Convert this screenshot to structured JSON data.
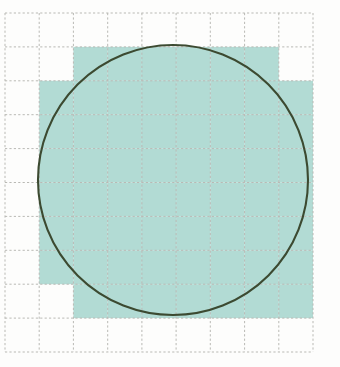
{
  "figure": {
    "background_color": "#fdfdfc"
  },
  "grid": {
    "columns": 9,
    "rows": 10,
    "origin_x": 5,
    "origin_y": 13,
    "cell_width": 34.22,
    "cell_height": 33.9,
    "line_color": "#b9b9b4",
    "line_style": "dotted",
    "line_width": 1,
    "x_lines": [
      5,
      39.2,
      73.4,
      107.7,
      141.9,
      176.1,
      210.3,
      244.6,
      278.8,
      313
    ],
    "y_lines": [
      13,
      46.9,
      80.8,
      114.7,
      148.6,
      182.5,
      216.4,
      250.3,
      284.2,
      318.1,
      352
    ]
  },
  "shading": {
    "fill_color": "#b2dbd4",
    "label": "cells counted as inside the circle",
    "cell_count": 68,
    "cells_per_row": [
      {
        "row": 0,
        "columns": []
      },
      {
        "row": 1,
        "columns": [
          2,
          3,
          4,
          5,
          6,
          7
        ]
      },
      {
        "row": 2,
        "columns": [
          1,
          2,
          3,
          4,
          5,
          6,
          7,
          8
        ]
      },
      {
        "row": 3,
        "columns": [
          1,
          2,
          3,
          4,
          5,
          6,
          7,
          8
        ]
      },
      {
        "row": 4,
        "columns": [
          1,
          2,
          3,
          4,
          5,
          6,
          7,
          8
        ]
      },
      {
        "row": 5,
        "columns": [
          1,
          2,
          3,
          4,
          5,
          6,
          7,
          8
        ]
      },
      {
        "row": 6,
        "columns": [
          1,
          2,
          3,
          4,
          5,
          6,
          7,
          8
        ]
      },
      {
        "row": 7,
        "columns": [
          1,
          2,
          3,
          4,
          5,
          6,
          7,
          8
        ]
      },
      {
        "row": 8,
        "columns": [
          2,
          3,
          4,
          5,
          6,
          7,
          8
        ]
      },
      {
        "row": 9,
        "columns": []
      }
    ]
  },
  "circle": {
    "center_x": 173,
    "center_y": 180,
    "radius": 135,
    "stroke_color": "#3c4a31",
    "stroke_width": 2.1,
    "fill": "none",
    "diameter_in_cells": 8,
    "top_y": 45,
    "bottom_y": 315,
    "left_x": 38,
    "right_x": 308
  },
  "chart_data": {
    "type": "area",
    "xlabel": "",
    "ylabel": "",
    "grid": true,
    "legend": "none",
    "xlim": [
      0,
      9
    ],
    "ylim": [
      0,
      10
    ],
    "series": [
      {
        "name": "circle",
        "kind": "circle-outline",
        "center": [
          4.91,
          4.92
        ],
        "radius_in_cells": 3.95,
        "color": "#3c4a31"
      },
      {
        "name": "shaded-cells",
        "kind": "filled-grid-cells",
        "color": "#b2dbd4",
        "values": [
          0,
          6,
          8,
          8,
          8,
          8,
          8,
          8,
          7,
          0
        ],
        "categories": [
          "row 0",
          "row 1",
          "row 2",
          "row 3",
          "row 4",
          "row 5",
          "row 6",
          "row 7",
          "row 8",
          "row 9"
        ],
        "total": 61
      }
    ]
  }
}
